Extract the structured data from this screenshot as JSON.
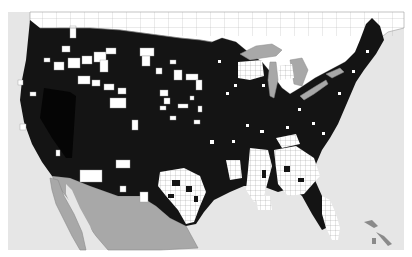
{
  "map": {
    "type": "choropleth",
    "region": "Contiguous United States (county level) with southern Canada and northern Mexico",
    "legend": null,
    "title": null,
    "colors": {
      "background": "#ffffff",
      "water": "#e6e6e6",
      "present": "#141414",
      "absent": "#ffffff",
      "canada": "#ffffff",
      "mexico": "#a8a8a8",
      "lakes": "#a8a8a8",
      "borders": "#8a8a8a",
      "county_lines": "#9a9a9a",
      "nevada_region": "#050505"
    },
    "regions": [
      {
        "name": "canada",
        "fill": "white with province/county outlines"
      },
      {
        "name": "mexico",
        "fill": "gray"
      },
      {
        "name": "great-lakes",
        "fill": "gray"
      },
      {
        "name": "us-present-counties",
        "fill": "black",
        "extent": "most of the US"
      },
      {
        "name": "us-absent-counties",
        "fill": "white",
        "extent": "scattered in West, Upper Midwest, dense clusters in Texas, Deep South, Florida"
      },
      {
        "name": "nevada",
        "fill": "solid black (darker, no county lines)"
      }
    ]
  }
}
